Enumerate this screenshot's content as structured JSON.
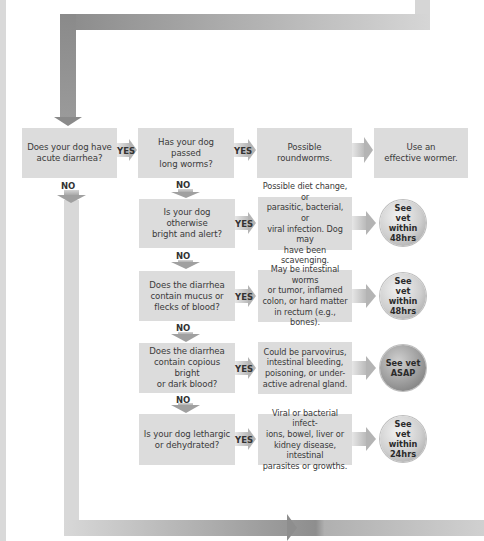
{
  "flowchart": {
    "start": {
      "question": "Does your dog have\nacute diarrhea?",
      "yes_label": "YES",
      "no_label": "NO"
    },
    "worms": {
      "question": "Has your dog passed\nlong worms?",
      "yes_label": "YES",
      "no_label": "NO",
      "result": "Possible roundworms.",
      "action": "Use an\neffective wormer."
    },
    "steps": [
      {
        "question": "Is your dog otherwise\nbright and alert?",
        "yes_label": "YES",
        "no_label": "NO",
        "result": "Possible diet change, or\nparasitic, bacterial, or\nviral infection. Dog may\nhave been scavenging.",
        "action": "See\nvet within\n48hrs"
      },
      {
        "question": "Does the diarrhea\ncontain mucus or\nflecks of blood?",
        "yes_label": "YES",
        "no_label": "NO",
        "result": "May be intestinal worms\nor tumor, inflamed\ncolon, or hard matter\nin rectum (e.g., bones).",
        "action": "See\nvet within\n48hrs"
      },
      {
        "question": "Does the diarrhea\ncontain copious bright\nor dark blood?",
        "yes_label": "YES",
        "no_label": "NO",
        "result": "Could be parvovirus,\nintestinal bleeding,\npoisoning, or under-\nactive adrenal gland.",
        "action": "See vet\nASAP"
      },
      {
        "question": "Is your dog lethargic\nor dehydrated?",
        "yes_label": "YES",
        "result": "Viral or bacterial infect-\nions, bowel, liver or\nkidney disease, intestinal\nparasites or growths.",
        "action": "See\nvet within\n24hrs"
      }
    ]
  },
  "colors": {
    "box": "#dcdcdc",
    "arrow_dark": "#8c8c8c",
    "arrow_light": "#d4d4d4",
    "text": "#3a3a3a"
  }
}
